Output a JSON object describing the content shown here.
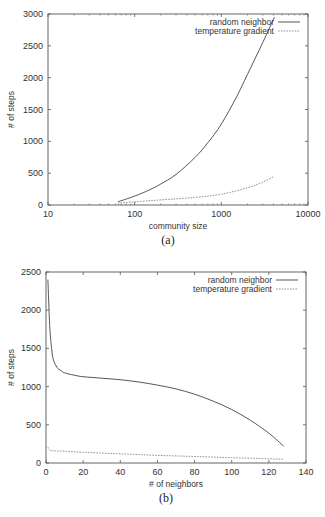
{
  "chart_data": [
    {
      "id": "a",
      "type": "line",
      "caption": "(a)",
      "title": "",
      "xlabel": "community size",
      "ylabel": "# of steps",
      "xscale": "log",
      "xlim": [
        10,
        10000
      ],
      "ylim": [
        0,
        3000
      ],
      "xticks": [
        10,
        100,
        1000,
        10000
      ],
      "xtick_labels": [
        "10",
        "100",
        "1000",
        "10000"
      ],
      "yticks": [
        0,
        500,
        1000,
        1500,
        2000,
        2500,
        3000
      ],
      "ytick_labels": [
        "0",
        "500",
        "1000",
        "1500",
        "2000",
        "2500",
        "3000"
      ],
      "grid": false,
      "legend_position": "top-right",
      "series": [
        {
          "name": "random neighbor",
          "style": "solid",
          "x": [
            64,
            100,
            150,
            200,
            300,
            500,
            700,
            1000,
            1500,
            2000,
            3000,
            4096
          ],
          "values": [
            50,
            140,
            240,
            330,
            480,
            750,
            980,
            1270,
            1700,
            2050,
            2550,
            2950
          ]
        },
        {
          "name": "temperature gradient",
          "style": "dashed",
          "x": [
            64,
            100,
            200,
            500,
            1000,
            2000,
            3000,
            4096
          ],
          "values": [
            30,
            50,
            80,
            120,
            170,
            270,
            360,
            450
          ]
        }
      ]
    },
    {
      "id": "b",
      "type": "line",
      "caption": "(b)",
      "title": "",
      "xlabel": "# of neighbors",
      "ylabel": "# of steps",
      "xscale": "linear",
      "xlim": [
        0,
        140
      ],
      "ylim": [
        0,
        2500
      ],
      "xticks": [
        0,
        20,
        40,
        60,
        80,
        100,
        120,
        140
      ],
      "xtick_labels": [
        "0",
        "20",
        "40",
        "60",
        "80",
        "100",
        "120",
        "140"
      ],
      "yticks": [
        0,
        500,
        1000,
        1500,
        2000,
        2500
      ],
      "ytick_labels": [
        "0",
        "500",
        "1000",
        "1500",
        "2000",
        "2500"
      ],
      "grid": false,
      "legend_position": "top-right",
      "series": [
        {
          "name": "random neighbor",
          "style": "solid",
          "x": [
            1,
            2,
            3,
            4,
            6,
            8,
            10,
            15,
            20,
            30,
            40,
            50,
            60,
            70,
            80,
            90,
            100,
            110,
            120,
            128
          ],
          "values": [
            2400,
            1800,
            1500,
            1350,
            1250,
            1210,
            1180,
            1150,
            1130,
            1110,
            1090,
            1060,
            1020,
            970,
            900,
            810,
            700,
            560,
            390,
            220
          ]
        },
        {
          "name": "temperature gradient",
          "style": "dashed",
          "x": [
            1,
            2,
            4,
            10,
            20,
            40,
            60,
            80,
            100,
            120,
            128
          ],
          "values": [
            210,
            170,
            160,
            155,
            140,
            120,
            100,
            85,
            70,
            55,
            50
          ]
        }
      ]
    }
  ]
}
